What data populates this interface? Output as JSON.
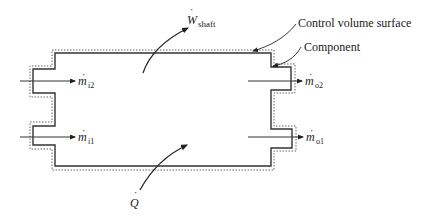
{
  "diagram": {
    "labels": {
      "control_volume_surface": "Control volume surface",
      "component": "Component",
      "work_symbol": "W",
      "work_subscript": "shaft",
      "heat_symbol": "Q",
      "mass_symbol": "m",
      "inlet_2_subscript": "i2",
      "inlet_1_subscript": "i1",
      "outlet_2_subscript": "o2",
      "outlet_1_subscript": "o1",
      "dot": "·"
    },
    "colors": {
      "line": "#333333",
      "text": "#1a1a1a",
      "background": "#ffffff"
    }
  }
}
